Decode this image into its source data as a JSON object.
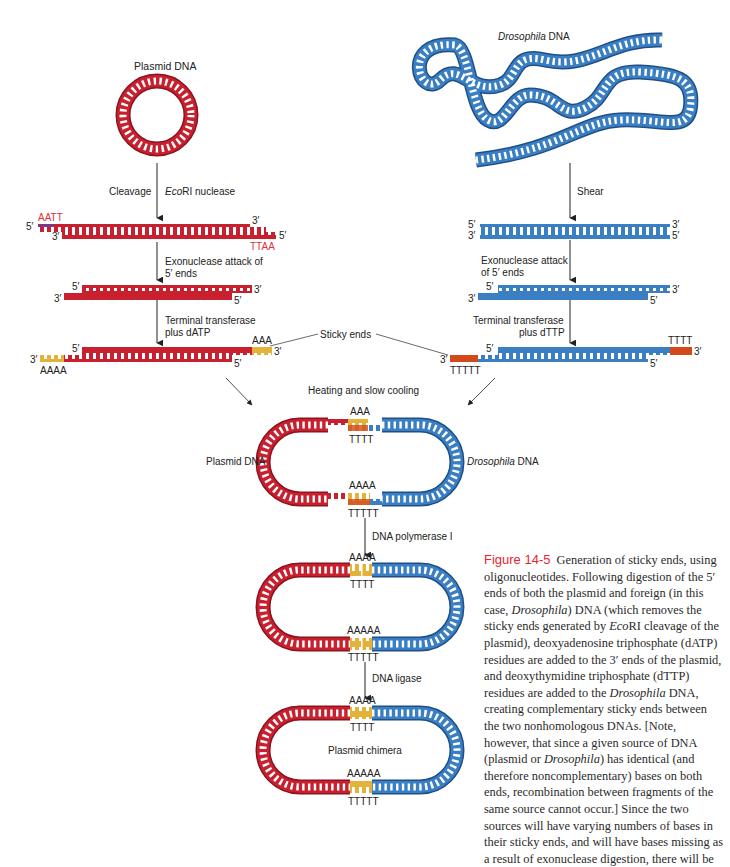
{
  "figure": {
    "number": "Figure 14-5",
    "caption_parts": [
      "Generation of sticky ends, using oligonucleotides. Following digestion of the 5′ ends of both the plasmid and foreign (in this case, ",
      "Drosophila",
      ") DNA (which removes the sticky ends generated by ",
      "Eco",
      "RI cleavage of the plasmid), deoxyadenosine triphosphate (dATP) residues are added to the 3′ ends of the plasmid, and deoxythymidine triphosphate (dTTP) residues are added to the ",
      "Drosophila",
      " DNA, creating complementary sticky ends between the two nonhomologous DNAs. [Note, however, that since a given source of DNA (plasmid or ",
      "Drosophila",
      ") has identical (and therefore noncomplementary) bases on both ends, recombination between fragments of the same source cannot occur.] Since the two sources will have varying numbers of bases in their sticky ends, and will have bases missing as a result of exonuclease digestion, there will be"
    ]
  },
  "left_column": {
    "title": "Plasmid DNA",
    "step1_left": "Cleavage",
    "step1_right_italic": "Eco",
    "step1_right": "RI nuclease",
    "cut_top_overhang": "AATT",
    "cut_bottom_overhang": "TTAA",
    "step2_line1": "Exonuclease attack of",
    "step2_line2": "5′ ends",
    "step3_line1": "Terminal transferase",
    "step3_line2": "plus dATP",
    "tail_right": "AAA",
    "tail_left": "AAAA"
  },
  "right_column": {
    "title_italic": "Drosophila",
    "title": "DNA",
    "step1": "Shear",
    "step2_line1": "Exonuclease attack",
    "step2_line2": "of 5′ ends",
    "step3_line1": "Terminal transferase",
    "step3_line2": "plus dTTP",
    "tail_right": "TTTT",
    "tail_left": "TTTTT"
  },
  "center": {
    "sticky_ends": "Sticky ends",
    "heating": "Heating and slow cooling",
    "annealed_left_label": "Plasmid DNA",
    "annealed_right_label_italic": "Drosophila",
    "annealed_right_label": "DNA",
    "annealed_top_a": "AAA",
    "annealed_top_t": "TTTT",
    "annealed_bot_a": "AAAA",
    "annealed_bot_t": "TTTTT",
    "step_polymerase": "DNA polymerase I",
    "filled_top_a": "AAAA",
    "filled_top_t": "TTTT",
    "filled_bot_a": "AAAAA",
    "filled_bot_t": "TTTTT",
    "step_ligase": "DNA ligase",
    "chimera_top_a": "AAAA",
    "chimera_top_t": "TTTT",
    "chimera_label": "Plasmid chimera",
    "chimera_bot_a": "AAAAA",
    "chimera_bot_t": "TTTTT"
  },
  "ends": {
    "five": "5′",
    "three": "3′"
  },
  "colors": {
    "plasmid_red": "#c8202f",
    "plasmid_dark": "#8a1420",
    "drosophila_blue": "#3a7fc4",
    "drosophila_dark": "#1f4f86",
    "a_tail_gold": "#e2b23a",
    "t_tail_orange": "#d24a1c",
    "caption_red": "#e8262f"
  }
}
